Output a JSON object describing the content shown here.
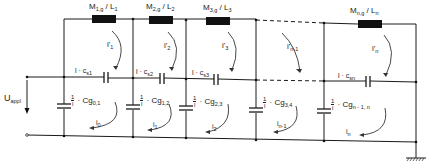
{
  "diagram": {
    "type": "ladder-network-schematic",
    "source_label": "U",
    "source_label_sub": "appl",
    "inductors": [
      {
        "main": "M",
        "sub": "1,g",
        "sep": " / ",
        "L": "L",
        "Lsub": "1"
      },
      {
        "main": "M",
        "sub": "2,g",
        "sep": " / ",
        "L": "L",
        "Lsub": "2"
      },
      {
        "main": "M",
        "sub": "3,g",
        "sep": " / ",
        "L": "L",
        "Lsub": "3"
      },
      {
        "main": "M",
        "sub": "n,g",
        "sep": " / ",
        "L": "L",
        "Lsub": "n"
      }
    ],
    "series_caps": [
      {
        "pre": "l · c",
        "sub": "s1"
      },
      {
        "pre": "l · c",
        "sub": "s2"
      },
      {
        "pre": "l · c",
        "sub": "s3"
      },
      {
        "pre": "l · c",
        "sub": "sn"
      }
    ],
    "shunt_caps": [
      {
        "num": "1",
        "den": "l",
        "pre": " · Cg",
        "sub": "0,1"
      },
      {
        "num": "1",
        "den": "l",
        "pre": " · Cg",
        "sub": "1,2"
      },
      {
        "num": "1",
        "den": "l",
        "pre": " · Cg",
        "sub": "2,3"
      },
      {
        "num": "1",
        "den": "l",
        "pre": " · Cg",
        "sub": "3,4"
      },
      {
        "num": "1",
        "den": "l",
        "pre": " · Cg",
        "sub": "n - 1, n"
      }
    ],
    "upper_loop_currents": [
      {
        "base": "i'",
        "sub": "1"
      },
      {
        "base": "i'",
        "sub": "2"
      },
      {
        "base": "i'",
        "sub": "3"
      },
      {
        "base": "i'",
        "sub": "n-1"
      },
      {
        "base": "i'",
        "sub": "n"
      }
    ],
    "lower_loop_currents": [
      {
        "base": "i",
        "sub": "0"
      },
      {
        "base": "i",
        "sub": "1"
      },
      {
        "base": "i",
        "sub": "2"
      },
      {
        "base": "i",
        "sub": "n-1"
      },
      {
        "base": "i",
        "sub": "n"
      }
    ],
    "ground": "ground-symbol"
  }
}
